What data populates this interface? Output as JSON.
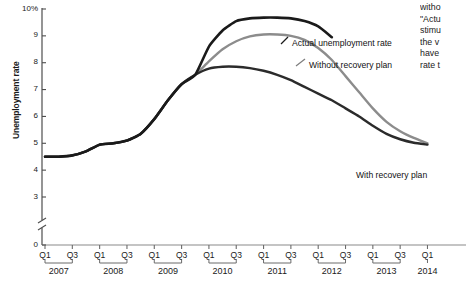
{
  "chart_data": {
    "type": "line",
    "title": "",
    "xlabel": "",
    "ylabel": "Unemployment rate",
    "ylim": [
      0,
      10
    ],
    "ytick_labels": [
      "10%",
      "9",
      "8",
      "7",
      "6",
      "5",
      "4",
      "3",
      "0"
    ],
    "ytick_values": [
      10,
      9,
      8,
      7,
      6,
      5,
      4,
      3,
      0
    ],
    "axis_break": true,
    "axis_break_note": "y-axis broken between 0 and 3",
    "grid": false,
    "legend_position": "inline-annotations",
    "x_tick_labels": [
      "Q1",
      "Q3",
      "Q1",
      "Q3",
      "Q1",
      "Q3",
      "Q1",
      "Q3",
      "Q1",
      "Q3",
      "Q1",
      "Q3",
      "Q1",
      "Q3",
      "Q1"
    ],
    "years": [
      "2007",
      "2008",
      "2009",
      "2010",
      "2011",
      "2012",
      "2013",
      "2014"
    ],
    "x": [
      "2007Q1",
      "2007Q2",
      "2007Q3",
      "2007Q4",
      "2008Q1",
      "2008Q2",
      "2008Q3",
      "2008Q4",
      "2009Q1",
      "2009Q2",
      "2009Q3",
      "2009Q4",
      "2010Q1",
      "2010Q2",
      "2010Q3",
      "2010Q4",
      "2011Q1",
      "2011Q2",
      "2011Q3",
      "2011Q4",
      "2012Q1",
      "2012Q2",
      "2012Q3",
      "2012Q4",
      "2013Q1",
      "2013Q2",
      "2013Q3",
      "2013Q4",
      "2014Q1"
    ],
    "series": [
      {
        "name": "Actual unemployment rate",
        "color": "#1a1a1a",
        "width": 2.6,
        "label_x": 292,
        "label_y": 38,
        "values": [
          4.5,
          4.5,
          4.55,
          4.7,
          4.95,
          5.0,
          5.1,
          5.35,
          5.9,
          6.6,
          7.2,
          7.55,
          8.6,
          9.2,
          9.55,
          9.65,
          9.68,
          9.68,
          9.65,
          9.55,
          9.35,
          8.95,
          null,
          null,
          null,
          null,
          null,
          null,
          null
        ]
      },
      {
        "name": "Without recovery plan",
        "color": "#8c8c8c",
        "width": 2.4,
        "label_x": 309,
        "label_y": 60,
        "values": [
          4.5,
          4.5,
          4.55,
          4.7,
          4.95,
          5.0,
          5.1,
          5.35,
          5.9,
          6.6,
          7.2,
          7.55,
          8.05,
          8.5,
          8.8,
          8.98,
          9.05,
          9.05,
          9.0,
          8.85,
          8.55,
          8.1,
          7.5,
          6.9,
          6.3,
          5.8,
          5.45,
          5.2,
          5.0
        ]
      },
      {
        "name": "With recovery plan",
        "color": "#2b2b2b",
        "width": 2.4,
        "label_x": 356,
        "label_y": 170,
        "values": [
          4.5,
          4.5,
          4.55,
          4.7,
          4.95,
          5.0,
          5.1,
          5.35,
          5.9,
          6.6,
          7.2,
          7.55,
          7.78,
          7.85,
          7.85,
          7.8,
          7.7,
          7.55,
          7.35,
          7.1,
          6.85,
          6.6,
          6.3,
          6.0,
          5.65,
          5.35,
          5.15,
          5.02,
          4.95
        ]
      }
    ],
    "annotations": [
      {
        "text": "Actual unemployment rate",
        "leader": true
      },
      {
        "text": "Without recovery plan",
        "leader": true
      },
      {
        "text": "With recovery plan",
        "leader": true
      }
    ]
  },
  "side_text": {
    "lines": [
      "witho",
      "\"Actu",
      "stimu",
      "the v",
      "have",
      "rate t"
    ]
  }
}
